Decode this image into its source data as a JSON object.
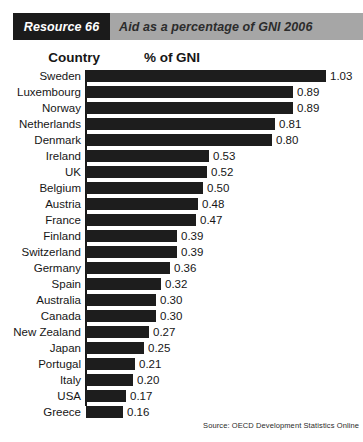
{
  "header": {
    "resource_tag": "Resource 66",
    "title": "Aid as a percentage of GNI 2006"
  },
  "columns": {
    "country": "Country",
    "value": "% of GNI"
  },
  "source": "Source: OECD Development Statistics Online",
  "chart_data": {
    "type": "bar",
    "orientation": "horizontal",
    "title": "Aid as a percentage of GNI 2006",
    "xlabel": "% of GNI",
    "ylabel": "Country",
    "xlim": [
      0,
      1.03
    ],
    "grid": false,
    "legend": false,
    "value_labels": true,
    "categories": [
      "Sweden",
      "Luxembourg",
      "Norway",
      "Netherlands",
      "Denmark",
      "Ireland",
      "UK",
      "Belgium",
      "Austria",
      "France",
      "Finland",
      "Switzerland",
      "Germany",
      "Spain",
      "Australia",
      "Canada",
      "New Zealand",
      "Japan",
      "Portugal",
      "Italy",
      "USA",
      "Greece"
    ],
    "values": [
      1.03,
      0.89,
      0.89,
      0.81,
      0.8,
      0.53,
      0.52,
      0.5,
      0.48,
      0.47,
      0.39,
      0.39,
      0.36,
      0.32,
      0.3,
      0.3,
      0.27,
      0.25,
      0.21,
      0.2,
      0.17,
      0.16
    ],
    "value_texts": [
      "1.03",
      "0.89",
      "0.89",
      "0.81",
      "0.80",
      "0.53",
      "0.52",
      "0.50",
      "0.48",
      "0.47",
      "0.39",
      "0.39",
      "0.36",
      "0.32",
      "0.30",
      "0.30",
      "0.27",
      "0.25",
      "0.21",
      "0.20",
      "0.17",
      "0.16"
    ]
  },
  "colors": {
    "bar": "#1d1d1d",
    "tag_background": "#1b1b1b",
    "header_background": "#a6a6a6",
    "page_background": "#ffffff"
  }
}
